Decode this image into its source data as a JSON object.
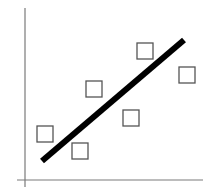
{
  "chart_data": {
    "type": "scatter",
    "title": "",
    "xlabel": "",
    "ylabel": "",
    "grid": false,
    "legend": null,
    "xlim": [
      0,
      180
    ],
    "ylim": [
      0,
      172
    ],
    "series": [
      {
        "name": "data points",
        "marker": "open-square",
        "points": [
          {
            "x": 20,
            "y": 46
          },
          {
            "x": 55,
            "y": 29
          },
          {
            "x": 69,
            "y": 91
          },
          {
            "x": 106,
            "y": 62
          },
          {
            "x": 120,
            "y": 129
          },
          {
            "x": 162,
            "y": 105
          }
        ]
      },
      {
        "name": "fit line",
        "type": "line",
        "points": [
          {
            "x": 17,
            "y": 19
          },
          {
            "x": 159,
            "y": 140
          }
        ]
      }
    ],
    "annotations": []
  },
  "style": {
    "axis_color": "#7a7a7a",
    "marker_stroke": "#555555",
    "line_color": "#000000",
    "background": "#ffffff"
  },
  "layout": {
    "origin_px": [
      25,
      180
    ],
    "yaxis_top_px": 8,
    "yaxis_bottom_px": 187,
    "xaxis_left_px": 17,
    "xaxis_right_px": 203,
    "marker_size_px": 16,
    "line_width_px": 6
  }
}
